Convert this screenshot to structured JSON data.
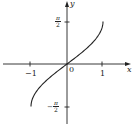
{
  "chart_data": {
    "type": "line",
    "title": "",
    "function": "y = arcsin(x)",
    "xlabel": "x",
    "ylabel": "y",
    "xlim": [
      -1,
      1
    ],
    "ylim": [
      -1.5708,
      1.5708
    ],
    "grid": false,
    "x": [
      -1,
      -0.9,
      -0.7,
      -0.5,
      -0.3,
      0,
      0.3,
      0.5,
      0.7,
      0.9,
      1
    ],
    "series": [
      {
        "name": "arcsin(x)",
        "values": [
          -1.5708,
          -1.1198,
          -0.7754,
          -0.5236,
          -0.3047,
          0,
          0.3047,
          0.5236,
          0.7754,
          1.1198,
          1.5708
        ]
      }
    ],
    "x_ticks": [
      "-1",
      "0",
      "1"
    ],
    "y_ticks": [
      "π/2",
      "-π/2"
    ]
  },
  "labels": {
    "x_axis": "x",
    "y_axis": "y",
    "origin": "0",
    "x_neg_one": "−1",
    "x_pos_one": "1",
    "pi": "π",
    "two": "2",
    "neg_sign": "−"
  }
}
